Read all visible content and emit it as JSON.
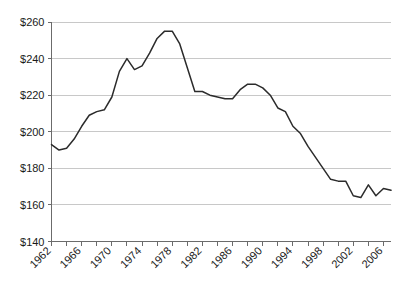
{
  "chart_data": {
    "type": "line",
    "title": "",
    "subtitle": "",
    "xlabel": "",
    "ylabel": "",
    "grid": "horizontal",
    "legend": "none",
    "ylim": [
      140,
      260
    ],
    "ytick_step": 20,
    "ytick_labels": [
      "$260",
      "$240",
      "$220",
      "$200",
      "$180",
      "$160",
      "$140"
    ],
    "ytick_values": [
      260,
      240,
      220,
      200,
      180,
      160,
      140
    ],
    "xlim": [
      1962,
      2007
    ],
    "xtick_labels": [
      "1962",
      "1966",
      "1970",
      "1974",
      "1978",
      "1982",
      "1986",
      "1990",
      "1994",
      "1998",
      "2002",
      "2006"
    ],
    "xtick_values": [
      1962,
      1966,
      1970,
      1974,
      1978,
      1982,
      1986,
      1990,
      1994,
      1998,
      2002,
      2006
    ],
    "xtick_minor_values": [
      1964,
      1968,
      1972,
      1976,
      1980,
      1984,
      1988,
      1992,
      1996,
      2000,
      2004
    ],
    "xtick_label_rotation": -45,
    "line_color": "#2b2b2b",
    "grid_color": "#c8c8c8",
    "axis_color": "#6b6b6b",
    "series": [
      {
        "name": "value",
        "x": [
          1962,
          1963,
          1964,
          1965,
          1966,
          1967,
          1968,
          1969,
          1970,
          1971,
          1972,
          1973,
          1974,
          1975,
          1976,
          1977,
          1978,
          1979,
          1980,
          1981,
          1982,
          1983,
          1984,
          1985,
          1986,
          1987,
          1988,
          1989,
          1990,
          1991,
          1992,
          1993,
          1994,
          1995,
          1996,
          1997,
          1998,
          1999,
          2000,
          2001,
          2002,
          2003,
          2004,
          2005,
          2006,
          2007
        ],
        "values": [
          193,
          190,
          191,
          196,
          203,
          209,
          211,
          212,
          219,
          233,
          240,
          234,
          236,
          243,
          251,
          255,
          255,
          248,
          235,
          222,
          222,
          220,
          219,
          218,
          218,
          223,
          226,
          226,
          224,
          220,
          213,
          211,
          203,
          199,
          192,
          186,
          180,
          174,
          173,
          173,
          165,
          164,
          171,
          165,
          169,
          168
        ]
      }
    ]
  }
}
